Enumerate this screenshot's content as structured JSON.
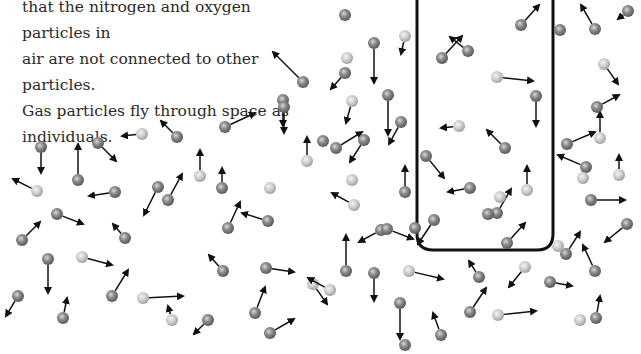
{
  "caption": {
    "lines": [
      "that the nitrogen and oxygen particles in",
      "air are not connected to other particles.",
      "Gas particles fly through space as",
      "individuals."
    ]
  },
  "colors": {
    "dark": "#7a7a7a",
    "light": "#c4c4c4",
    "arrow": "#111111",
    "box": "#111111"
  },
  "container": {
    "x": 417,
    "y": -12,
    "w": 136,
    "h": 262,
    "r": 16
  },
  "particles": [
    [
      303,
      82,
      "d",
      -30,
      -30
    ],
    [
      345,
      15,
      "d",
      0,
      0
    ],
    [
      283,
      100,
      "d",
      0,
      26
    ],
    [
      352,
      101,
      "l",
      -6,
      22
    ],
    [
      405,
      36,
      "l",
      -4,
      18
    ],
    [
      374,
      43,
      "d",
      0,
      40
    ],
    [
      345,
      73,
      "d",
      -14,
      16
    ],
    [
      388,
      95,
      "d",
      0,
      40
    ],
    [
      347,
      58,
      "l",
      0,
      0
    ],
    [
      41,
      147,
      "d",
      0,
      26
    ],
    [
      37,
      191,
      "l",
      -24,
      -12
    ],
    [
      78,
      180,
      "d",
      0,
      -36
    ],
    [
      98,
      143,
      "d",
      18,
      18
    ],
    [
      115,
      192,
      "d",
      -26,
      4
    ],
    [
      142,
      134,
      "l",
      -20,
      2
    ],
    [
      177,
      137,
      "d",
      -16,
      -16
    ],
    [
      158,
      187,
      "d",
      -14,
      28
    ],
    [
      168,
      200,
      "d",
      14,
      -26
    ],
    [
      200,
      176,
      "l",
      0,
      -26
    ],
    [
      22,
      240,
      "d",
      18,
      -18
    ],
    [
      57,
      214,
      "d",
      26,
      10
    ],
    [
      125,
      238,
      "d",
      -12,
      -14
    ],
    [
      48,
      259,
      "d",
      0,
      34
    ],
    [
      82,
      257,
      "l",
      30,
      8
    ],
    [
      112,
      296,
      "d",
      16,
      -26
    ],
    [
      63,
      318,
      "d",
      4,
      -20
    ],
    [
      18,
      296,
      "d",
      -12,
      20
    ],
    [
      143,
      298,
      "l",
      40,
      -2
    ],
    [
      172,
      320,
      "l",
      -4,
      -14
    ],
    [
      208,
      320,
      "d",
      -14,
      14
    ],
    [
      228,
      228,
      "d",
      12,
      -26
    ],
    [
      222,
      188,
      "d",
      0,
      -20
    ],
    [
      268,
      221,
      "d",
      -26,
      -8
    ],
    [
      307,
      161,
      "l",
      0,
      -24
    ],
    [
      270,
      188,
      "l",
      0,
      0
    ],
    [
      225,
      127,
      "d",
      30,
      -14
    ],
    [
      284,
      107,
      "d",
      0,
      26
    ],
    [
      336,
      148,
      "d",
      26,
      -16
    ],
    [
      364,
      140,
      "d",
      -14,
      22
    ],
    [
      401,
      122,
      "d",
      -12,
      22
    ],
    [
      405,
      192,
      "d",
      0,
      -26
    ],
    [
      354,
      205,
      "l",
      -22,
      -12
    ],
    [
      323,
      141,
      "d",
      0,
      0
    ],
    [
      352,
      180,
      "l",
      0,
      0
    ],
    [
      223,
      271,
      "d",
      -14,
      -16
    ],
    [
      266,
      268,
      "d",
      28,
      4
    ],
    [
      255,
      313,
      "d",
      10,
      -26
    ],
    [
      270,
      333,
      "d",
      24,
      -14
    ],
    [
      313,
      284,
      "l",
      14,
      20
    ],
    [
      330,
      290,
      "l",
      -22,
      -12
    ],
    [
      346,
      271,
      "d",
      0,
      -36
    ],
    [
      374,
      273,
      "d",
      0,
      28
    ],
    [
      400,
      303,
      "d",
      0,
      36
    ],
    [
      381,
      230,
      "d",
      -22,
      12
    ],
    [
      387,
      229,
      "d",
      26,
      10
    ],
    [
      415,
      228,
      "d",
      0,
      0
    ],
    [
      405,
      345,
      "d",
      0,
      0
    ],
    [
      442,
      58,
      "d",
      20,
      -22
    ],
    [
      468,
      51,
      "d",
      -18,
      -14
    ],
    [
      497,
      77,
      "l",
      36,
      4
    ],
    [
      536,
      96,
      "d",
      0,
      30
    ],
    [
      521,
      25,
      "d",
      18,
      -20
    ],
    [
      459,
      126,
      "l",
      -18,
      2
    ],
    [
      426,
      156,
      "d",
      18,
      22
    ],
    [
      470,
      188,
      "d",
      -22,
      4
    ],
    [
      434,
      220,
      "d",
      -16,
      24
    ],
    [
      497,
      213,
      "d",
      14,
      -24
    ],
    [
      505,
      148,
      "d",
      -18,
      -18
    ],
    [
      527,
      190,
      "l",
      0,
      -24
    ],
    [
      507,
      243,
      "d",
      18,
      -20
    ],
    [
      488,
      214,
      "d",
      0,
      0
    ],
    [
      500,
      197,
      "l",
      0,
      0
    ],
    [
      567,
      144,
      "d",
      28,
      -12
    ],
    [
      586,
      167,
      "d",
      -28,
      -12
    ],
    [
      600,
      138,
      "l",
      0,
      -26
    ],
    [
      591,
      200,
      "d",
      34,
      0
    ],
    [
      566,
      254,
      "d",
      14,
      -22
    ],
    [
      627,
      224,
      "d",
      -22,
      18
    ],
    [
      595,
      271,
      "d",
      -12,
      -26
    ],
    [
      596,
      318,
      "d",
      4,
      -22
    ],
    [
      583,
      178,
      "l",
      0,
      0
    ],
    [
      619,
      175,
      "l",
      0,
      -20
    ],
    [
      604,
      64,
      "l",
      14,
      20
    ],
    [
      597,
      107,
      "d",
      22,
      -12
    ],
    [
      595,
      29,
      "d",
      -14,
      -24
    ],
    [
      560,
      30,
      "d",
      0,
      0
    ],
    [
      628,
      11,
      "d",
      -10,
      8
    ],
    [
      409,
      271,
      "l",
      34,
      8
    ],
    [
      479,
      277,
      "d",
      -10,
      -16
    ],
    [
      470,
      312,
      "d",
      16,
      -24
    ],
    [
      441,
      335,
      "d",
      -8,
      -22
    ],
    [
      498,
      315,
      "l",
      38,
      -4
    ],
    [
      550,
      282,
      "d",
      22,
      4
    ],
    [
      558,
      246,
      "l",
      0,
      0
    ],
    [
      525,
      267,
      "l",
      -16,
      20
    ],
    [
      580,
      320,
      "l",
      0,
      0
    ]
  ]
}
